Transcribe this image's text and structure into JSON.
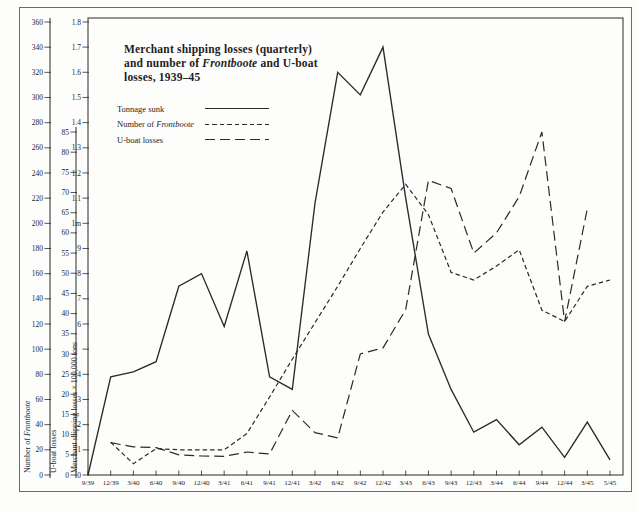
{
  "figure": {
    "title_line1": "Merchant shipping losses (quarterly)",
    "title_line2_pre": "and number of ",
    "title_line2_italic": "Frontboote",
    "title_line2_post": " and U-boat",
    "title_line3": "losses, 1939–45"
  },
  "legend": {
    "items": [
      {
        "label": "Tonnage sunk",
        "style": "solid"
      },
      {
        "label_pre": "Number of ",
        "label_italic": "Frontboote",
        "style": "short-dash"
      },
      {
        "label": "U-boat losses",
        "style": "long-dash"
      }
    ]
  },
  "axes": {
    "frontboote": {
      "title_pre": "Number of ",
      "title_italic": "Frontboote",
      "min": 0,
      "max": 360,
      "tick_step": 20
    },
    "uboat": {
      "title": "U-boat losses",
      "min": 0,
      "max": 85,
      "tick_step": 5
    },
    "merchant": {
      "title": "Merchant shipping losses × 100,000 tons",
      "min": 0,
      "max": 18,
      "tick_step": 1,
      "tick_labels": [
        "0",
        "1",
        "2",
        "3",
        "4",
        "",
        "6",
        "7",
        "8",
        "9",
        "1m",
        "1.1",
        "1.2",
        "1.3",
        "1.4",
        "1.5",
        "1.6",
        "1.7",
        "1.8"
      ]
    }
  },
  "chart_data": {
    "type": "line",
    "categories": [
      "9/39",
      "12/39",
      "3/40",
      "6/40",
      "9/40",
      "12/40",
      "3/41",
      "6/41",
      "9/41",
      "12/41",
      "3/42",
      "6/42",
      "9/42",
      "12/42",
      "3/43",
      "6/43",
      "9/43",
      "12/43",
      "3/44",
      "6/44",
      "9/44",
      "12/44",
      "3/45",
      "5/45"
    ],
    "series": [
      {
        "name": "Tonnage sunk",
        "axis": "merchant",
        "unit": "100,000 tons",
        "dash": "solid",
        "values": [
          0,
          3.9,
          4.1,
          4.5,
          7.5,
          8.0,
          5.9,
          8.9,
          3.9,
          3.4,
          10.8,
          16.0,
          15.1,
          17.0,
          11.0,
          5.6,
          3.4,
          1.7,
          2.2,
          1.2,
          1.9,
          0.7,
          2.1,
          0.6
        ]
      },
      {
        "name": "Number of Frontboote",
        "axis": "frontboote",
        "unit": "boats",
        "dash": "short-dash",
        "values": [
          null,
          26,
          9,
          21,
          20,
          20,
          20,
          33,
          62,
          92,
          121,
          150,
          180,
          209,
          231,
          207,
          161,
          155,
          166,
          179,
          131,
          122,
          150,
          155
        ]
      },
      {
        "name": "U-boat losses",
        "axis": "uboat",
        "unit": "boats",
        "dash": "long-dash",
        "values": [
          null,
          8,
          7,
          6.8,
          5,
          4.7,
          4.6,
          5.7,
          5.2,
          16,
          10.5,
          9.2,
          30,
          31.5,
          41,
          73,
          71,
          55,
          60,
          69,
          85,
          38,
          66,
          null
        ]
      }
    ],
    "axis_ranges": {
      "merchant_100k_tons": [
        0,
        18
      ],
      "frontboote": [
        0,
        360
      ],
      "uboat_losses": [
        0,
        85
      ]
    },
    "legend_position": "upper-left",
    "grid": false
  }
}
